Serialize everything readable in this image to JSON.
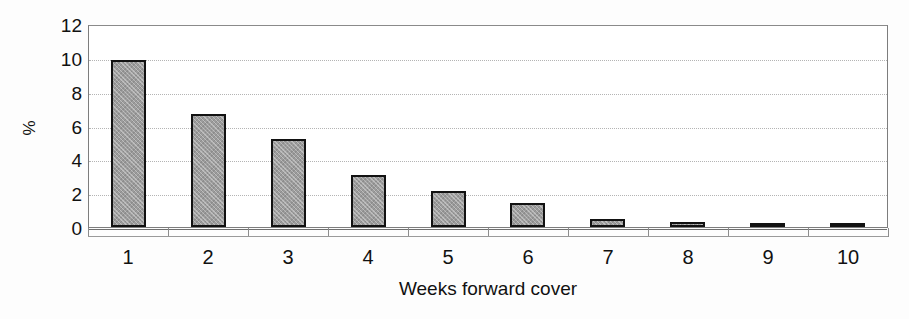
{
  "chart_data": {
    "type": "bar",
    "title": "",
    "subtitle": "",
    "xlabel": "Weeks forward cover",
    "ylabel": "%",
    "categories": [
      "1",
      "2",
      "3",
      "4",
      "5",
      "6",
      "7",
      "8",
      "9",
      "10"
    ],
    "values": [
      9.9,
      6.7,
      5.2,
      3.05,
      2.1,
      1.4,
      0.45,
      0.3,
      0.25,
      0.1
    ],
    "series": [
      {
        "name": "Share of firms",
        "values": [
          9.9,
          6.7,
          5.2,
          3.05,
          2.1,
          1.4,
          0.45,
          0.3,
          0.25,
          0.1
        ]
      }
    ],
    "ylim": [
      0,
      12
    ],
    "ytick_values": [
      12,
      10,
      8,
      6,
      4,
      2,
      0
    ],
    "ytick_labels": [
      "12",
      "10",
      "8",
      "6",
      "4",
      "2",
      "0"
    ],
    "xlim_categories": 10,
    "grid": {
      "horizontal": true,
      "vertical": false,
      "style": "dotted"
    },
    "legend": {
      "visible": false,
      "position": "none",
      "entries": []
    },
    "annotations": [],
    "colors": {
      "bar_fill": "#9c9c9c",
      "bar_border": "#121212",
      "gridline": "#b4b4b4",
      "axis": "#7d7d7d",
      "text": "#111111",
      "plot_background": "#ffffff",
      "figure_background": "#fdfdfd"
    }
  }
}
